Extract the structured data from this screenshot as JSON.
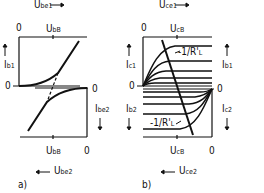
{
  "panel_a": {
    "caption": "a)",
    "top_axis_label": "U",
    "top_axis_sub": "be1",
    "bottom_axis_label": "U",
    "bottom_axis_sub": "be2",
    "top_zero": "0",
    "top_tick_label": "U",
    "top_tick_sub": "bB",
    "bottom_tick_label": "U",
    "bottom_tick_sub": "bB",
    "bottom_zero": "0",
    "left_axis_label": "I",
    "left_axis_sub": "b1",
    "right_axis_label": "I",
    "right_axis_sub": "be2",
    "left_zero": "0",
    "right_zero": "0"
  },
  "panel_b": {
    "caption": "b)",
    "top_axis_label": "U",
    "top_axis_sub": "ce1",
    "bottom_axis_label": "U",
    "bottom_axis_sub": "ce2",
    "top_zero": "0",
    "top_tick_label": "U",
    "top_tick_sub": "cB",
    "bottom_tick_label": "U",
    "bottom_tick_sub": "cB",
    "bottom_zero": "0",
    "left_top_label": "I",
    "left_top_sub": "c1",
    "right_top_label": "I",
    "right_top_sub": "b1",
    "left_bottom_label": "I",
    "left_bottom_sub": "b2",
    "right_bottom_label": "I",
    "right_bottom_sub": "c2",
    "left_zero": "0",
    "right_zero": "0",
    "loadline_top": "-1/R'",
    "loadline_top_sub": "L",
    "loadline_bottom": "-1/R'",
    "loadline_bottom_sub": "L"
  }
}
